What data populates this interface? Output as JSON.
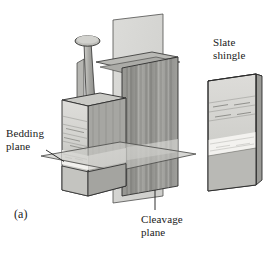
{
  "figure": {
    "panel_label": "(a)",
    "background_color": "#ffffff",
    "ink_color": "#1a1a1a"
  },
  "labels": {
    "bedding_plane": "Bedding\nplane",
    "cleavage_plane": "Cleavage\nplane",
    "slate_shingle": "Slate\nshingle"
  },
  "diagram": {
    "colors": {
      "rock_front_light": "#d9d9d6",
      "rock_front_mid": "#c9c9c5",
      "rock_front_dark": "#b4b4b0",
      "rock_band_white": "#f2f1ee",
      "rock_side_dark": "#8e8e8a",
      "rock_side_mid": "#a3a39f",
      "rock_top": "#c2c2be",
      "plane_fill": "#c6c6c2",
      "plane_stroke": "#4a4a48",
      "nail_body": "#a8a8a4",
      "nail_head": "#bdbdb9",
      "outline": "#2b2b2b",
      "bedding_line": "#8a8a86"
    },
    "elements": [
      "roofing-nail",
      "slate-block-stack",
      "bedding-plane-sheet",
      "cleavage-plane-sheet",
      "slate-shingle-slab"
    ]
  }
}
